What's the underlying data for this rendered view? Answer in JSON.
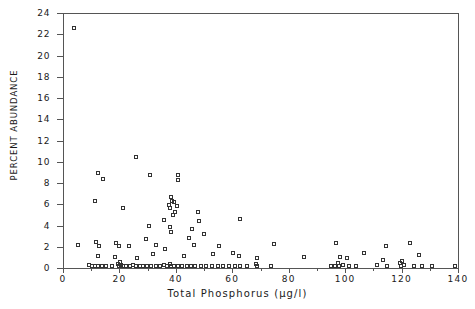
{
  "chart_data": {
    "type": "scatter",
    "title": "",
    "xlabel": "Total Phosphorus (µg/l)",
    "ylabel": "PERCENT ABUNDANCE",
    "xlim": [
      0,
      140
    ],
    "ylim": [
      0,
      24
    ],
    "grid": false,
    "legend": null,
    "marker": "open-square",
    "xticks": [
      0,
      20,
      40,
      60,
      80,
      100,
      120,
      140
    ],
    "xtick_labels": [
      "0",
      "20",
      "40",
      "60",
      "80",
      "100",
      "120",
      "140"
    ],
    "xticks_minor": [
      10,
      30,
      50,
      70,
      90,
      110,
      130
    ],
    "yticks": [
      0,
      2,
      4,
      6,
      8,
      10,
      12,
      14,
      16,
      18,
      20,
      22,
      24
    ],
    "ytick_labels": [
      "0",
      "2",
      "4",
      "6",
      "8",
      "10",
      "12",
      "14",
      "16",
      "18",
      "20",
      "22",
      "24"
    ],
    "points": [
      [
        4.0,
        22.5
      ],
      [
        26.0,
        10.4
      ],
      [
        12.5,
        8.9
      ],
      [
        31.0,
        8.7
      ],
      [
        41.0,
        8.7
      ],
      [
        41.0,
        8.2
      ],
      [
        14.5,
        8.3
      ],
      [
        11.5,
        6.3
      ],
      [
        38.5,
        6.6
      ],
      [
        38.8,
        6.3
      ],
      [
        39.6,
        6.2
      ],
      [
        37.8,
        5.9
      ],
      [
        40.5,
        5.8
      ],
      [
        38.2,
        5.6
      ],
      [
        21.5,
        5.6
      ],
      [
        40.0,
        5.2
      ],
      [
        48.0,
        5.2
      ],
      [
        39.0,
        4.9
      ],
      [
        36.0,
        4.5
      ],
      [
        48.5,
        4.4
      ],
      [
        63.0,
        4.6
      ],
      [
        30.5,
        3.9
      ],
      [
        38.0,
        3.8
      ],
      [
        46.0,
        3.6
      ],
      [
        38.5,
        3.3
      ],
      [
        50.0,
        3.2
      ],
      [
        45.0,
        2.8
      ],
      [
        29.5,
        2.7
      ],
      [
        5.5,
        2.1
      ],
      [
        12.0,
        2.4
      ],
      [
        13.0,
        2.0
      ],
      [
        19.0,
        2.3
      ],
      [
        20.0,
        2.0
      ],
      [
        23.5,
        2.0
      ],
      [
        33.0,
        2.1
      ],
      [
        36.5,
        1.7
      ],
      [
        46.5,
        2.1
      ],
      [
        55.5,
        2.0
      ],
      [
        60.5,
        1.4
      ],
      [
        75.0,
        2.2
      ],
      [
        97.0,
        2.3
      ],
      [
        107.0,
        1.4
      ],
      [
        114.5,
        2.0
      ],
      [
        123.0,
        2.3
      ],
      [
        126.5,
        1.2
      ],
      [
        12.5,
        1.1
      ],
      [
        18.5,
        1.0
      ],
      [
        26.5,
        0.9
      ],
      [
        32.0,
        1.3
      ],
      [
        43.0,
        1.1
      ],
      [
        53.5,
        1.3
      ],
      [
        62.5,
        1.1
      ],
      [
        69.0,
        0.9
      ],
      [
        85.5,
        1.0
      ],
      [
        98.5,
        1.0
      ],
      [
        101.0,
        0.9
      ],
      [
        113.5,
        0.7
      ],
      [
        120.5,
        0.6
      ],
      [
        9.5,
        0.2
      ],
      [
        10.5,
        0.15
      ],
      [
        11.5,
        0.1
      ],
      [
        12.5,
        0.15
      ],
      [
        14.0,
        0.1
      ],
      [
        15.5,
        0.1
      ],
      [
        17.5,
        0.15
      ],
      [
        19.5,
        0.3
      ],
      [
        20.0,
        0.1
      ],
      [
        20.3,
        0.5
      ],
      [
        20.6,
        0.2
      ],
      [
        21.5,
        0.1
      ],
      [
        22.5,
        0.15
      ],
      [
        24.0,
        0.1
      ],
      [
        25.0,
        0.2
      ],
      [
        26.0,
        0.1
      ],
      [
        27.5,
        0.15
      ],
      [
        28.5,
        0.1
      ],
      [
        30.0,
        0.1
      ],
      [
        31.5,
        0.15
      ],
      [
        33.0,
        0.1
      ],
      [
        34.5,
        0.1
      ],
      [
        36.0,
        0.2
      ],
      [
        37.0,
        0.1
      ],
      [
        38.0,
        0.35
      ],
      [
        38.5,
        0.1
      ],
      [
        39.5,
        0.15
      ],
      [
        41.0,
        0.1
      ],
      [
        42.5,
        0.1
      ],
      [
        44.0,
        0.15
      ],
      [
        45.5,
        0.1
      ],
      [
        47.0,
        0.1
      ],
      [
        49.0,
        0.15
      ],
      [
        51.0,
        0.1
      ],
      [
        53.0,
        0.1
      ],
      [
        55.0,
        0.15
      ],
      [
        57.0,
        0.1
      ],
      [
        59.0,
        0.1
      ],
      [
        61.0,
        0.15
      ],
      [
        63.0,
        0.1
      ],
      [
        65.5,
        0.1
      ],
      [
        68.5,
        0.3
      ],
      [
        69.0,
        0.1
      ],
      [
        74.0,
        0.1
      ],
      [
        95.0,
        0.15
      ],
      [
        96.5,
        0.1
      ],
      [
        97.5,
        0.45
      ],
      [
        98.0,
        0.1
      ],
      [
        99.5,
        0.2
      ],
      [
        101.5,
        0.1
      ],
      [
        104.0,
        0.1
      ],
      [
        111.5,
        0.2
      ],
      [
        115.0,
        0.1
      ],
      [
        119.5,
        0.4
      ],
      [
        120.0,
        0.1
      ],
      [
        121.0,
        0.2
      ],
      [
        124.5,
        0.1
      ],
      [
        127.5,
        0.1
      ],
      [
        131.0,
        0.1
      ],
      [
        139.0,
        0.15
      ]
    ]
  }
}
